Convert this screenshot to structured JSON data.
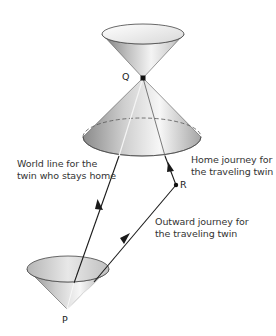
{
  "diagram": {
    "type": "spacetime light-cone diagram (twin paradox)",
    "points": {
      "P": {
        "label": "P",
        "x": 67,
        "y": 309
      },
      "Q": {
        "label": "Q",
        "x": 143,
        "y": 78
      },
      "R": {
        "label": "R",
        "x": 176,
        "y": 185
      }
    },
    "labels": {
      "stay_home": {
        "line1": "World line for the",
        "line2": "twin who stays home"
      },
      "home_journey": {
        "line1": "Home journey for",
        "line2": "the traveling twin"
      },
      "outward_journey": {
        "line1": "Outward journey for",
        "line2": "the traveling twin"
      }
    },
    "edges": [
      {
        "from": "P",
        "to": "Q",
        "name": "world line of stay-home twin",
        "arrow": true
      },
      {
        "from": "P",
        "to": "R",
        "name": "outward journey",
        "arrow": true
      },
      {
        "from": "R",
        "to": "Q",
        "name": "home journey",
        "arrow": true
      }
    ],
    "cones": [
      {
        "name": "future light cone of Q",
        "apex": "Q",
        "direction": "up"
      },
      {
        "name": "past light cone of Q",
        "apex": "Q",
        "direction": "down"
      },
      {
        "name": "future light cone of P",
        "apex": "P",
        "direction": "up"
      }
    ],
    "colors": {
      "line": "#1a1a1a",
      "cone_light": "#f2f2f2",
      "cone_dark": "#8c8c8c",
      "text": "#333333"
    }
  }
}
